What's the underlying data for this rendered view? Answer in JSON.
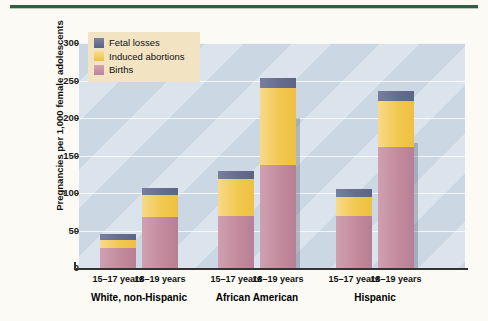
{
  "chart_data": {
    "type": "bar",
    "stacked": true,
    "title": "",
    "xlabel": "",
    "ylabel": "Pregnancies per 1,000 female adolescents",
    "ylim": [
      0,
      300
    ],
    "yticks": [
      0,
      50,
      100,
      150,
      200,
      250,
      300
    ],
    "ytick_labels": [
      "0",
      "50",
      "100",
      "150",
      "200",
      "250",
      "300"
    ],
    "grid": true,
    "legend_position": "top-left",
    "categories": [
      "15–17 years",
      "18–19 years",
      "15–17 years",
      "18–19 years",
      "15–17 years",
      "18–19 years"
    ],
    "groups": [
      {
        "label": "White, non-Hispanic",
        "categories": [
          "15–17 years",
          "18–19 years"
        ]
      },
      {
        "label": "African American",
        "categories": [
          "15–17 years",
          "18–19 years"
        ]
      },
      {
        "label": "Hispanic",
        "categories": [
          "15–17 years",
          "18–19 years"
        ]
      }
    ],
    "series": [
      {
        "name": "Births",
        "color": "#c48b9f",
        "values": [
          27,
          68,
          70,
          137,
          70,
          162
        ]
      },
      {
        "name": "Induced abortions",
        "color": "#f2c84f",
        "values": [
          11,
          30,
          49,
          103,
          25,
          61
        ]
      },
      {
        "name": "Fetal losses",
        "color": "#656c8e",
        "values": [
          8,
          9,
          11,
          13,
          10,
          13
        ]
      }
    ],
    "totals": [
      45,
      107,
      130,
      253,
      105,
      236
    ],
    "plot_background": "#ccd7e4",
    "top_rule_color": "#2f5f3f",
    "legend_background": "#f2e3c2"
  },
  "legend": {
    "items": [
      {
        "label": "Fetal losses"
      },
      {
        "label": "Induced abortions"
      },
      {
        "label": "Births"
      }
    ]
  },
  "axis": {
    "y_title": "Pregnancies per 1,000 female adolescents",
    "y_ticks": [
      "300",
      "250",
      "200",
      "150",
      "100",
      "50",
      "0"
    ]
  }
}
